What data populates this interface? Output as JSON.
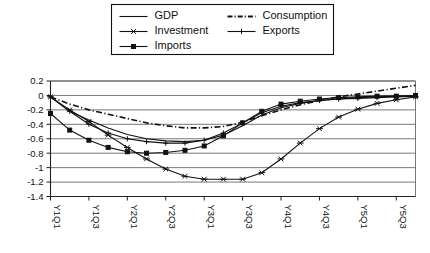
{
  "chart_data": {
    "type": "line",
    "title": "",
    "xlabel": "",
    "ylabel": "",
    "ylim": [
      -1.4,
      0.2
    ],
    "ytick_values": [
      0.2,
      0,
      -0.2,
      -0.4,
      -0.6,
      -0.8,
      -1,
      -1.2,
      -1.4
    ],
    "ytick_labels": [
      "0.2",
      "0",
      "-0.2",
      "-0.4",
      "-0.6",
      "-0.8",
      "-1",
      "-1.2",
      "-1.4"
    ],
    "grid": true,
    "legend_position": "top-center-outside",
    "x": [
      "Y1Q1",
      "Y1Q2",
      "Y1Q3",
      "Y1Q4",
      "Y2Q1",
      "Y2Q2",
      "Y2Q3",
      "Y2Q4",
      "Y3Q1",
      "Y3Q2",
      "Y3Q3",
      "Y3Q4",
      "Y4Q1",
      "Y4Q2",
      "Y4Q3",
      "Y4Q4",
      "Y5Q1",
      "Y5Q2",
      "Y5Q3",
      "Y5Q4"
    ],
    "xtick_labels": [
      "Y1Q1",
      "Y1Q3",
      "Y2Q1",
      "Y2Q3",
      "Y3Q1",
      "Y3Q3",
      "Y4Q1",
      "Y4Q3",
      "Y5Q1",
      "Y5Q3"
    ],
    "xtick_indices": [
      0,
      2,
      4,
      6,
      8,
      10,
      12,
      14,
      16,
      18
    ],
    "series": [
      {
        "name": "GDP",
        "marker": "none",
        "linestyle": "solid",
        "values": [
          -0.02,
          -0.22,
          -0.34,
          -0.45,
          -0.54,
          -0.6,
          -0.63,
          -0.64,
          -0.62,
          -0.55,
          -0.42,
          -0.27,
          -0.17,
          -0.11,
          -0.07,
          -0.05,
          -0.03,
          -0.02,
          -0.01,
          -0.01
        ]
      },
      {
        "name": "Consumption",
        "marker": "none",
        "linestyle": "dashdot",
        "values": [
          -0.02,
          -0.12,
          -0.2,
          -0.26,
          -0.32,
          -0.38,
          -0.42,
          -0.45,
          -0.45,
          -0.43,
          -0.37,
          -0.28,
          -0.2,
          -0.13,
          -0.07,
          -0.02,
          0.02,
          0.06,
          0.1,
          0.14
        ]
      },
      {
        "name": "Investment",
        "marker": "star",
        "linestyle": "solid",
        "values": [
          -0.02,
          -0.2,
          -0.36,
          -0.55,
          -0.72,
          -0.88,
          -1.02,
          -1.12,
          -1.16,
          -1.16,
          -1.16,
          -1.07,
          -0.88,
          -0.66,
          -0.46,
          -0.3,
          -0.19,
          -0.11,
          -0.06,
          -0.02
        ]
      },
      {
        "name": "Exports",
        "marker": "plus",
        "linestyle": "solid",
        "values": [
          -0.02,
          -0.22,
          -0.4,
          -0.52,
          -0.6,
          -0.64,
          -0.66,
          -0.66,
          -0.62,
          -0.52,
          -0.38,
          -0.24,
          -0.15,
          -0.1,
          -0.07,
          -0.05,
          -0.04,
          -0.03,
          -0.02,
          -0.01
        ]
      },
      {
        "name": "Imports",
        "marker": "square",
        "linestyle": "solid",
        "values": [
          -0.25,
          -0.48,
          -0.62,
          -0.72,
          -0.78,
          -0.8,
          -0.79,
          -0.76,
          -0.7,
          -0.56,
          -0.38,
          -0.22,
          -0.12,
          -0.08,
          -0.05,
          -0.03,
          -0.02,
          -0.01,
          -0.01,
          0.0
        ]
      }
    ]
  },
  "legend": {
    "entries": [
      {
        "label": "GDP",
        "marker": "none",
        "linestyle": "solid"
      },
      {
        "label": "Consumption",
        "marker": "none",
        "linestyle": "dashdot"
      },
      {
        "label": "Investment",
        "marker": "star",
        "linestyle": "solid"
      },
      {
        "label": "Exports",
        "marker": "plus",
        "linestyle": "solid"
      },
      {
        "label": "Imports",
        "marker": "square",
        "linestyle": "solid"
      }
    ]
  },
  "colors": {
    "ink": "#111111",
    "grid": "#555555",
    "background": "#ffffff"
  }
}
